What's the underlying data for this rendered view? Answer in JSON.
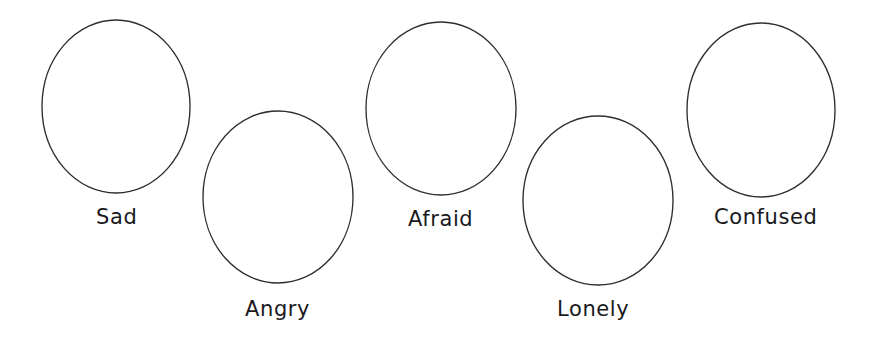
{
  "page": {
    "background_color": "#ffffff",
    "width": 876,
    "height": 349
  },
  "style": {
    "outline_color": "#2e2e32",
    "outline_width": 1.35,
    "fill_color": "#ffffff",
    "label_color": "#19191c",
    "label_font_size": 21
  },
  "shapes": [
    {
      "id": "ellipse-sad",
      "shape": "ellipse",
      "label": "Sad",
      "cx": 116,
      "cy": 106.5,
      "rx": 74,
      "ry": 86.5,
      "label_x": 96,
      "label_y": 207
    },
    {
      "id": "ellipse-angry",
      "shape": "ellipse",
      "label": "Angry",
      "cx": 278,
      "cy": 197,
      "rx": 75,
      "ry": 86,
      "label_x": 245,
      "label_y": 299
    },
    {
      "id": "ellipse-afraid",
      "shape": "ellipse",
      "label": "Afraid",
      "cx": 441,
      "cy": 108.5,
      "rx": 75,
      "ry": 86.5,
      "label_x": 408,
      "label_y": 209
    },
    {
      "id": "ellipse-lonely",
      "shape": "ellipse",
      "label": "Lonely",
      "cx": 598,
      "cy": 200.5,
      "rx": 75,
      "ry": 84.5,
      "label_x": 557,
      "label_y": 299
    },
    {
      "id": "ellipse-confused",
      "shape": "ellipse",
      "label": "Confused",
      "cx": 761,
      "cy": 110,
      "rx": 74,
      "ry": 87,
      "label_x": 714,
      "label_y": 207
    }
  ]
}
